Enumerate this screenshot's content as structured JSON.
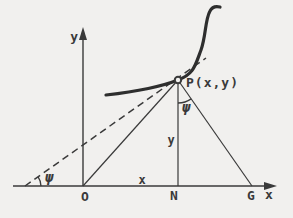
{
  "colors": {
    "background": "#f1f0ee",
    "ink": "#3a3a3a",
    "curve_ink": "#2e2e2e"
  },
  "labels": {
    "y_axis": "y",
    "x_axis": "x",
    "origin": "O",
    "abscissa": "x",
    "foot_N": "N",
    "point_G": "G",
    "ordinate": "y",
    "point_P": "P(x,y)",
    "psi_tangent": "ψ",
    "psi_at_P": "ψ"
  }
}
